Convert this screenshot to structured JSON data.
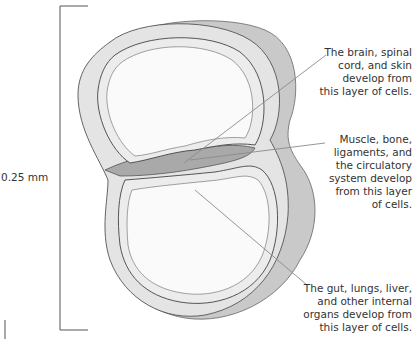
{
  "scale": {
    "label": "0.25 mm"
  },
  "labels": [
    {
      "id": "ectoderm",
      "lines": [
        "The brain, spinal",
        "cord, and skin",
        "develop from",
        "this layer of cells."
      ]
    },
    {
      "id": "mesoderm",
      "lines": [
        "Muscle, bone,",
        "ligaments, and",
        "the circulatory",
        "system develop",
        "from this layer",
        "of cells."
      ]
    },
    {
      "id": "endoderm",
      "lines": [
        "The gut, lungs, liver,",
        "and other internal",
        "organs develop from",
        "this layer of cells."
      ]
    }
  ],
  "colors": {
    "outer_shadow": "#c9c9c9",
    "outer_layer": "#e4e4e4",
    "middle_layer": "#a9a9a9",
    "inner_layer": "#ececec",
    "cavity": "#fafafa",
    "stroke": "#555555",
    "leader": "#8a8a8a"
  }
}
